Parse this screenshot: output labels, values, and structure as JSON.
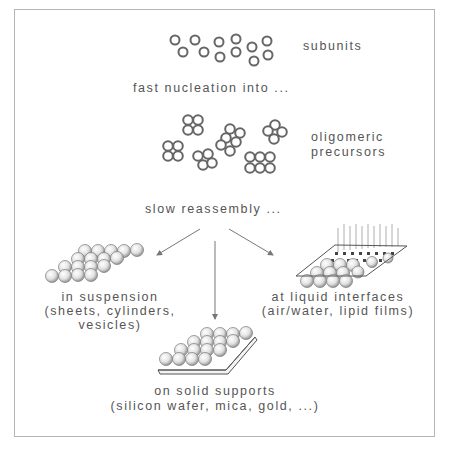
{
  "diagram": {
    "stages": {
      "subunits": "subunits",
      "nucleation": "fast nucleation into ...",
      "oligomeric_line1": "oligomeric",
      "oligomeric_line2": "precursors",
      "reassembly": "slow reassembly ..."
    },
    "outcomes": {
      "suspension": {
        "line1": "in suspension",
        "line2": "(sheets, cylinders,",
        "line3": "vesicles)"
      },
      "liquid": {
        "line1": "at liquid interfaces",
        "line2": "(air/water, lipid films)"
      },
      "solid": {
        "line1": "on solid supports",
        "line2": "(silicon wafer, mica, gold, ...)"
      }
    },
    "colors": {
      "frame": "#b5b5b5",
      "text": "#555555",
      "ring": "#666666",
      "arrow": "#777777"
    }
  }
}
